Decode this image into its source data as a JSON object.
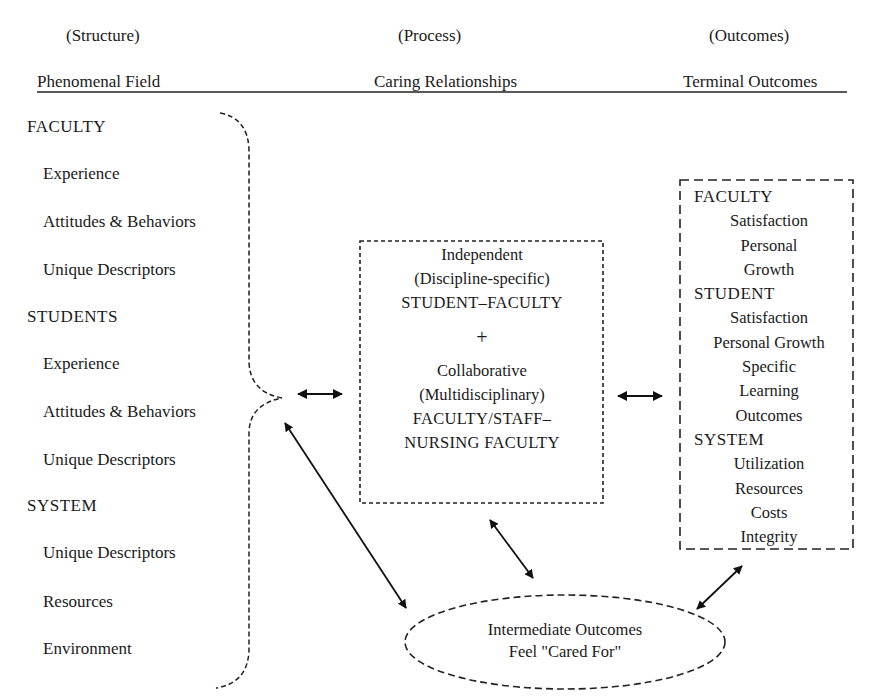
{
  "columns": [
    {
      "stage": "(Structure)",
      "heading": "Phenomenal Field"
    },
    {
      "stage": "(Process)",
      "heading": "Caring Relationships"
    },
    {
      "stage": "(Outcomes)",
      "heading": "Terminal Outcomes"
    }
  ],
  "structure": {
    "groups": [
      {
        "title": "FACULTY",
        "items": [
          "Experience",
          "Attitudes & Behaviors",
          "Unique Descriptors"
        ]
      },
      {
        "title": "STUDENTS",
        "items": [
          "Experience",
          "Attitudes & Behaviors",
          "Unique Descriptors"
        ]
      },
      {
        "title": "SYSTEM",
        "items": [
          "Unique Descriptors",
          "Resources",
          "Environment"
        ]
      }
    ]
  },
  "process_box": {
    "independent": [
      "Independent",
      "(Discipline-specific)",
      "STUDENT–FACULTY"
    ],
    "plus": "+",
    "collaborative": [
      "Collaborative",
      "(Multidisciplinary)",
      "FACULTY/STAFF–",
      "NURSING FACULTY"
    ]
  },
  "outcomes_box": {
    "faculty": {
      "title": "FACULTY",
      "items": [
        "Satisfaction",
        "Personal",
        "Growth"
      ]
    },
    "student": {
      "title": "STUDENT",
      "items": [
        "Satisfaction",
        "Personal Growth",
        "Specific",
        "Learning",
        "Outcomes"
      ]
    },
    "system": {
      "title": "SYSTEM",
      "items": [
        "Utilization",
        "Resources",
        "Costs",
        "Integrity"
      ]
    }
  },
  "intermediate": {
    "line1": "Intermediate Outcomes",
    "line2": "Feel \"Cared For\""
  }
}
